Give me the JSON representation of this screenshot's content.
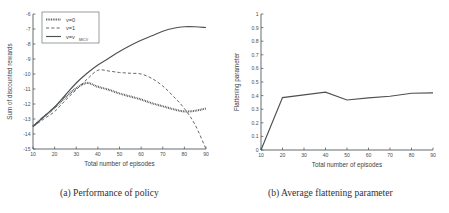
{
  "figure": {
    "panels": [
      {
        "id": "a",
        "caption": "(a) Performance of policy"
      },
      {
        "id": "b",
        "caption": "(b) Average flattening parameter"
      }
    ]
  },
  "chart_data": [
    {
      "type": "line",
      "panel": "a",
      "title": "",
      "xlabel": "Total number of episodes",
      "ylabel": "Sum of discounted rewards",
      "xlim": [
        10,
        90
      ],
      "ylim": [
        -15,
        -6
      ],
      "xticks": [
        10,
        20,
        30,
        40,
        50,
        60,
        70,
        80,
        90
      ],
      "yticks": [
        -15,
        -14,
        -13,
        -12,
        -11,
        -10,
        -9,
        -8,
        -7,
        -6
      ],
      "grid": false,
      "legend_position": "upper-left",
      "x": [
        10,
        15,
        20,
        25,
        30,
        35,
        40,
        45,
        50,
        55,
        60,
        65,
        70,
        75,
        80,
        85,
        90
      ],
      "series": [
        {
          "name": "v=0",
          "style": "dotted",
          "values": [
            -13.5,
            -12.85,
            -12.25,
            -11.55,
            -10.95,
            -10.6,
            -10.85,
            -11.05,
            -11.3,
            -11.5,
            -11.7,
            -11.95,
            -12.15,
            -12.35,
            -12.5,
            -12.45,
            -12.3
          ]
        },
        {
          "name": "v=1",
          "style": "dashed",
          "values": [
            -13.5,
            -13.0,
            -12.5,
            -11.75,
            -11.05,
            -10.35,
            -9.75,
            -9.8,
            -9.9,
            -9.95,
            -10.0,
            -10.3,
            -10.8,
            -11.5,
            -12.3,
            -13.4,
            -15.0
          ]
        },
        {
          "name": "v=v_MICV",
          "style": "solid",
          "values": [
            -13.5,
            -12.85,
            -12.2,
            -11.4,
            -10.6,
            -9.95,
            -9.4,
            -8.95,
            -8.5,
            -8.1,
            -7.75,
            -7.45,
            -7.15,
            -6.95,
            -6.85,
            -6.85,
            -6.9
          ]
        }
      ],
      "legend": [
        {
          "label": "v=0",
          "style": "dotted"
        },
        {
          "label": "v=1",
          "style": "dashed"
        },
        {
          "label": "v=v",
          "sub": "MICV",
          "style": "solid"
        }
      ]
    },
    {
      "type": "line",
      "panel": "b",
      "title": "",
      "xlabel": "Total number of episodes",
      "ylabel": "Flattening parameter",
      "xlim": [
        10,
        90
      ],
      "ylim": [
        0,
        1
      ],
      "xticks": [
        10,
        20,
        30,
        40,
        50,
        60,
        70,
        80,
        90
      ],
      "yticks": [
        0,
        0.1,
        0.2,
        0.3,
        0.4,
        0.5,
        0.6,
        0.7,
        0.8,
        0.9,
        1
      ],
      "ytick_labels": [
        "0",
        "0.1",
        "0.2",
        "0.3",
        "0.4",
        "0.5",
        "0.6",
        "0.7",
        "0.8",
        "0.9",
        "1"
      ],
      "grid": false,
      "legend_position": "none",
      "x": [
        10,
        20,
        30,
        40,
        50,
        60,
        70,
        80,
        90
      ],
      "series": [
        {
          "name": "Average flattening parameter",
          "style": "solid",
          "values": [
            0.0,
            0.385,
            0.405,
            0.425,
            0.368,
            0.383,
            0.395,
            0.417,
            0.42
          ]
        }
      ]
    }
  ]
}
